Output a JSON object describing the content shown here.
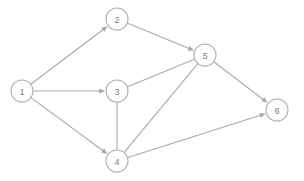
{
  "figure": {
    "type": "directed-graph",
    "width": 304,
    "height": 181,
    "background_color": "#ffffff",
    "node_fill_color": "#ffffff",
    "node_stroke_color": "#b0b0b0",
    "node_label_color": "#777777",
    "edge_color": "#a9a9a9",
    "node_radius": 11
  },
  "nodes": [
    {
      "id": "1",
      "label": "1",
      "x": 22,
      "y": 91
    },
    {
      "id": "2",
      "label": "2",
      "x": 117,
      "y": 19
    },
    {
      "id": "3",
      "label": "3",
      "x": 117,
      "y": 91
    },
    {
      "id": "4",
      "label": "4",
      "x": 117,
      "y": 161
    },
    {
      "id": "5",
      "label": "5",
      "x": 205,
      "y": 55
    },
    {
      "id": "6",
      "label": "6",
      "x": 277,
      "y": 110
    }
  ],
  "edges": [
    {
      "id": "e1",
      "source": "1",
      "target": "2",
      "directed": true,
      "label": ""
    },
    {
      "id": "e2",
      "source": "1",
      "target": "3",
      "directed": true,
      "label": ""
    },
    {
      "id": "e3",
      "source": "1",
      "target": "4",
      "directed": true,
      "label": ""
    },
    {
      "id": "e4",
      "source": "2",
      "target": "5",
      "directed": true,
      "label": ""
    },
    {
      "id": "e5",
      "source": "3",
      "target": "5",
      "directed": false,
      "label": ""
    },
    {
      "id": "e6",
      "source": "3",
      "target": "4",
      "directed": false,
      "label": ""
    },
    {
      "id": "e7",
      "source": "4",
      "target": "5",
      "directed": false,
      "label": ""
    },
    {
      "id": "e8",
      "source": "5",
      "target": "6",
      "directed": true,
      "label": ""
    },
    {
      "id": "e9",
      "source": "4",
      "target": "6",
      "directed": true,
      "label": ""
    }
  ]
}
